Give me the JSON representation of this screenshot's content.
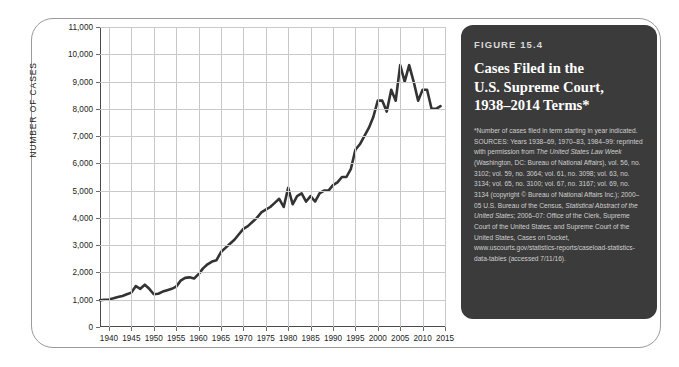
{
  "figure": {
    "number_label": "FIGURE 15.4",
    "title_lines": [
      "Cases Filed in the",
      "U.S. Supreme Court,",
      "1938–2014 Terms*"
    ],
    "footnote": "*Number of cases filed in term starting in year indicated.",
    "sources": "SOURCES: Years 1938–69, 1970–83, 1984–99: reprinted with permission from ",
    "sources_italic_1": "The United States Law Week",
    "sources_2": " (Washington, DC: Bureau of National Affairs), vol. 56, no. 3102; vol. 59, no. 3064; vol. 61, no. 3098; vol. 63, no. 3134; vol. 65, no. 3100; vol. 67, no. 3167; vol. 69, no. 3134 (copyright © Bureau of National Affairs Inc.); 2000–05 U.S. Bureau of the Census, ",
    "sources_italic_2": "Statistical Abstract of the United States",
    "sources_3": "; 2006–07: Office of the Clerk, Supreme Court of the United States; and Supreme Court of the United States, Cases on Docket, www.uscourts.gov/statistics-reports/caseload-statistics-data-tables (accessed 7/11/16).",
    "panel_bg": "#3b3b3b"
  },
  "chart_data": {
    "type": "line",
    "title": "Cases Filed in the U.S. Supreme Court, 1938–2014 Terms",
    "xlabel": "",
    "ylabel": "NUMBER OF CASES",
    "xlim": [
      1938,
      2015
    ],
    "ylim": [
      0,
      11000
    ],
    "ytick_labels": [
      "0",
      "1,000",
      "2,000",
      "3,000",
      "4,000",
      "5,000",
      "6,000",
      "7,000",
      "8,000",
      "9,000",
      "10,000",
      "11,000"
    ],
    "ytick_values": [
      0,
      1000,
      2000,
      3000,
      4000,
      5000,
      6000,
      7000,
      8000,
      9000,
      10000,
      11000
    ],
    "xtick_labels": [
      "1940",
      "1945",
      "1950",
      "1955",
      "1960",
      "1965",
      "1970",
      "1975",
      "1980",
      "1985",
      "1990",
      "1995",
      "2000",
      "2005",
      "2010",
      "2015"
    ],
    "xtick_values": [
      1940,
      1945,
      1950,
      1955,
      1960,
      1965,
      1970,
      1975,
      1980,
      1985,
      1990,
      1995,
      2000,
      2005,
      2010,
      2015
    ],
    "grid": true,
    "legend": false,
    "line_color": "#333333",
    "x": [
      1938,
      1939,
      1940,
      1941,
      1942,
      1943,
      1944,
      1945,
      1946,
      1947,
      1948,
      1949,
      1950,
      1951,
      1952,
      1953,
      1954,
      1955,
      1956,
      1957,
      1958,
      1959,
      1960,
      1961,
      1962,
      1963,
      1964,
      1965,
      1966,
      1967,
      1968,
      1969,
      1970,
      1971,
      1972,
      1973,
      1974,
      1975,
      1976,
      1977,
      1978,
      1979,
      1980,
      1981,
      1982,
      1983,
      1984,
      1985,
      1986,
      1987,
      1988,
      1989,
      1990,
      1991,
      1992,
      1993,
      1994,
      1995,
      1996,
      1997,
      1998,
      1999,
      2000,
      2001,
      2002,
      2003,
      2004,
      2005,
      2006,
      2007,
      2008,
      2009,
      2010,
      2011,
      2012,
      2013,
      2014
    ],
    "values": [
      980,
      1000,
      1010,
      1050,
      1100,
      1140,
      1200,
      1260,
      1500,
      1400,
      1550,
      1400,
      1200,
      1220,
      1300,
      1350,
      1400,
      1480,
      1700,
      1800,
      1820,
      1780,
      1940,
      2150,
      2300,
      2400,
      2450,
      2750,
      2900,
      3050,
      3200,
      3400,
      3600,
      3700,
      3850,
      4000,
      4200,
      4300,
      4400,
      4550,
      4700,
      4400,
      5100,
      4500,
      4800,
      4900,
      4600,
      4800,
      4600,
      4900,
      5000,
      5000,
      5200,
      5300,
      5500,
      5500,
      5800,
      6500,
      6700,
      7000,
      7300,
      7700,
      8300,
      8300,
      7900,
      8700,
      8300,
      9600,
      9000,
      9600,
      9000,
      8300,
      8700,
      8700,
      8000,
      8000,
      8100
    ]
  }
}
